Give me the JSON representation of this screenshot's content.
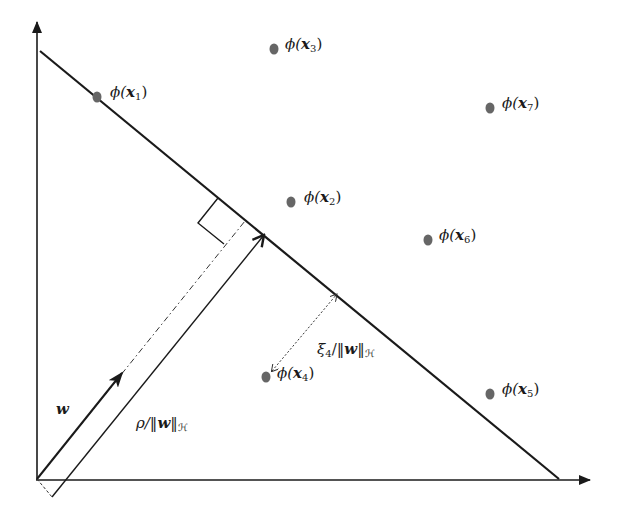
{
  "diagram": {
    "title": "",
    "axes": {
      "origin": [
        37,
        479
      ],
      "x_axis_end": [
        590,
        479
      ],
      "y_axis_end": [
        37,
        22
      ]
    },
    "hyperplane": {
      "from": [
        40,
        51
      ],
      "to": [
        559,
        479
      ]
    },
    "colors": {
      "line": "#1a1a1a",
      "point": "#666666",
      "background": "#ffffff"
    },
    "points": [
      {
        "id": "x1",
        "phi": "ϕ(",
        "var": "x",
        "sub": "1",
        "close": ")",
        "x": 97,
        "y": 97
      },
      {
        "id": "x2",
        "phi": "ϕ(",
        "var": "x",
        "sub": "2",
        "close": ")",
        "x": 291,
        "y": 202
      },
      {
        "id": "x3",
        "phi": "ϕ(",
        "var": "x",
        "sub": "3",
        "close": ")",
        "x": 274,
        "y": 49
      },
      {
        "id": "x4",
        "phi": "ϕ(",
        "var": "x",
        "sub": "4",
        "close": ")",
        "x": 266,
        "y": 377
      },
      {
        "id": "x5",
        "phi": "ϕ(",
        "var": "x",
        "sub": "5",
        "close": ")",
        "x": 490,
        "y": 394
      },
      {
        "id": "x6",
        "phi": "ϕ(",
        "var": "x",
        "sub": "6",
        "close": ")",
        "x": 428,
        "y": 240
      },
      {
        "id": "x7",
        "phi": "ϕ(",
        "var": "x",
        "sub": "7",
        "close": ")",
        "x": 490,
        "y": 108
      }
    ],
    "labels": {
      "w": "w",
      "rho_pre": "ρ/‖",
      "rho_w": "w",
      "rho_post": "‖",
      "rho_sub": "ℋ",
      "xi_pre": "ξ",
      "xi_sub": "4",
      "xi_mid": "/‖",
      "xi_w": "w",
      "xi_post": "‖",
      "xi_sub2": "ℋ"
    }
  }
}
